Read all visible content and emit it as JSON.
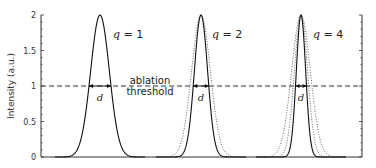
{
  "chart_data": {
    "type": "line",
    "title": "",
    "xlabel": "",
    "ylabel": "Intensity (a.u.)",
    "ylim": [
      0,
      2
    ],
    "yticks": [
      0,
      0.5,
      1,
      1.5,
      2
    ],
    "ytick_labels": [
      "0",
      "0.5",
      "1",
      "1.5",
      "2"
    ],
    "y_minor_step": 0.1,
    "grid": false,
    "legend": null,
    "threshold": {
      "value": 1,
      "label_line1": "ablation",
      "label_line2": "threshold",
      "style": "dashed"
    },
    "width_label": "d",
    "peak_value": 2,
    "base_sigma_px": 9.35,
    "groups": [
      {
        "label_q": "q",
        "label_eq": " = 1",
        "q": 1,
        "center_px": 100,
        "solid_order": 1,
        "dotted_orders": []
      },
      {
        "label_q": "q",
        "label_eq": " = 2",
        "q": 2,
        "center_px": 201,
        "solid_order": 2,
        "dotted_orders": [
          1
        ]
      },
      {
        "label_q": "q",
        "label_eq": " = 4",
        "q": 4,
        "center_px": 301,
        "solid_order": 4,
        "dotted_orders": [
          1,
          2
        ]
      }
    ],
    "series_description": "Intensity profile I(x) = 2·exp(-q·x²/2σ²); solid = order q, dotted = lower orders for comparison; d = width where I crosses ablation threshold (I = 1)"
  },
  "labels": {
    "y_axis": "Intensity (a.u.)",
    "threshold_line1": "ablation",
    "threshold_line2": "threshold",
    "d": "d",
    "q": "q",
    "q1_eq": " = 1",
    "q2_eq": " = 2",
    "q4_eq": " = 4",
    "tick_0": "0",
    "tick_05": "0.5",
    "tick_1": "1",
    "tick_15": "1.5",
    "tick_2": "2"
  }
}
